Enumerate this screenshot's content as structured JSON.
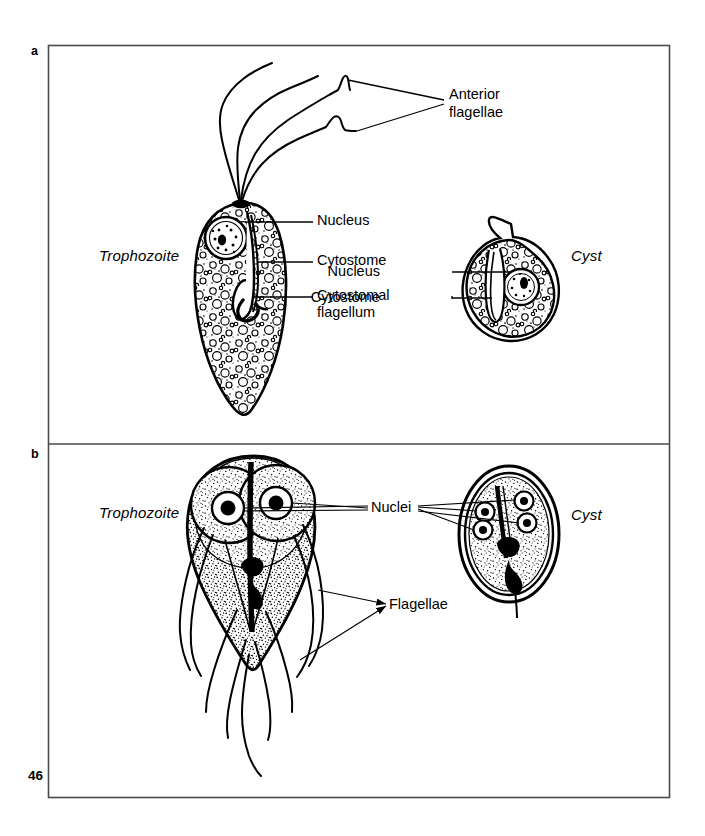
{
  "page": {
    "page_number": "46",
    "background_color": "#ffffff",
    "ink_color": "#000000",
    "frame": {
      "x": 48,
      "y": 45,
      "width": 622,
      "height": 753,
      "divider_y": 444
    }
  },
  "panels": [
    {
      "letter": "a",
      "organism_hint": "flagellate protozoan with cytostome",
      "labels": {
        "trophozoite": "Trophozoite",
        "cyst": "Cyst",
        "anterior_flagellae": "Anterior\nflagellae",
        "nucleus": "Nucleus",
        "cytostome": "Cytostome",
        "cytostomal_flagellum": "Cytostomal\nflagellum",
        "cyst_nucleus": "Nucleus",
        "cyst_cytostome": "Cytostome"
      }
    },
    {
      "letter": "b",
      "organism_hint": "binucleate pear-shaped flagellate",
      "labels": {
        "trophozoite": "Trophozoite",
        "cyst": "Cyst",
        "nuclei": "Nuclei",
        "flagellae": "Flagellae"
      }
    }
  ],
  "label_text": {
    "anterior_flagellae_line1": "Anterior",
    "anterior_flagellae_line2": "flagellae",
    "nucleus": "Nucleus",
    "cytostome": "Cytostome",
    "cytostomal_line1": "Cytostomal",
    "cytostomal_line2": "flagellum",
    "cyst_nucleus": "Nucleus",
    "cyst_cytostome": "Cytostome",
    "trophozoite_a": "Trophozoite",
    "cyst_a": "Cyst",
    "trophozoite_b": "Trophozoite",
    "cyst_b": "Cyst",
    "nuclei": "Nuclei",
    "flagellae": "Flagellae",
    "panel_a_letter": "a",
    "panel_b_letter": "b",
    "page_number": "46"
  }
}
